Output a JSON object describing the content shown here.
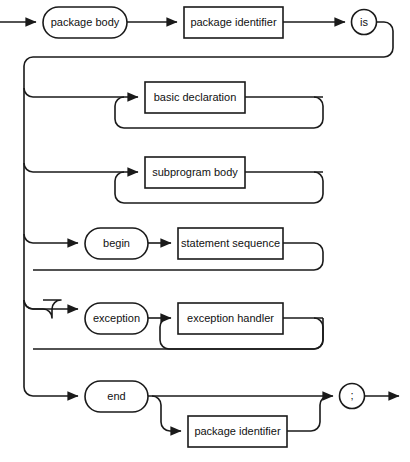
{
  "diagram": {
    "kind": "railroad-syntax-diagram",
    "title": "package body",
    "colors": {
      "background": "#ffffff",
      "line": "#1a1a1a",
      "text": "#111111",
      "node_fill": "#ffffff"
    },
    "nodes": {
      "package_body": {
        "label": "package body",
        "shape": "oval",
        "role": "terminal"
      },
      "package_identifier_head": {
        "label": "package identifier",
        "shape": "box",
        "role": "nonterminal"
      },
      "is": {
        "label": "is",
        "shape": "circle",
        "role": "terminal"
      },
      "basic_declaration": {
        "label": "basic declaration",
        "shape": "box",
        "role": "nonterminal"
      },
      "subprogram_body": {
        "label": "subprogram body",
        "shape": "box",
        "role": "nonterminal"
      },
      "begin": {
        "label": "begin",
        "shape": "oval",
        "role": "terminal"
      },
      "statement_sequence": {
        "label": "statement sequence",
        "shape": "box",
        "role": "nonterminal"
      },
      "exception": {
        "label": "exception",
        "shape": "oval",
        "role": "terminal"
      },
      "exception_handler": {
        "label": "exception handler",
        "shape": "box",
        "role": "nonterminal"
      },
      "end": {
        "label": "end",
        "shape": "oval",
        "role": "terminal"
      },
      "semicolon": {
        "label": ";",
        "shape": "circle",
        "role": "terminal"
      },
      "package_identifier_tail": {
        "label": "package identifier",
        "shape": "box",
        "role": "nonterminal"
      }
    },
    "branches": [
      {
        "name": "basic-declaration-branch",
        "repeat": true
      },
      {
        "name": "subprogram-body-branch",
        "repeat": true
      },
      {
        "name": "begin-statement-sequence-branch",
        "repeat": false
      },
      {
        "name": "exception-handler-branch",
        "repeat": true
      },
      {
        "name": "end-branch",
        "repeat": false
      },
      {
        "name": "optional-package-identifier",
        "repeat": false
      }
    ]
  }
}
